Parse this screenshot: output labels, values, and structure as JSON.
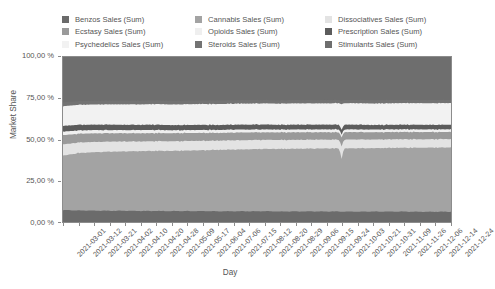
{
  "chart_data": {
    "type": "area",
    "stacked": true,
    "normalized": true,
    "title": "",
    "xlabel": "Day",
    "ylabel": "Market Share",
    "ylim": [
      0,
      100
    ],
    "yunit": "%",
    "grid": false,
    "legend_position": "top",
    "y_tick_labels": [
      "0,00 %",
      "25,00 %",
      "50,00 %",
      "75,00 %",
      "100,00 %"
    ],
    "y_tick_values": [
      0,
      25,
      50,
      75,
      100
    ],
    "x_tick_labels": [
      "2021-03-01",
      "2021-03-12",
      "2021-03-21",
      "2021-04-02",
      "2021-04-10",
      "2021-04-20",
      "2021-04-28",
      "2021-05-09",
      "2021-05-17",
      "2021-06-04",
      "2021-07-06",
      "2021-07-15",
      "2021-08-12",
      "2021-08-20",
      "2021-08-29",
      "2021-09-06",
      "2021-09-15",
      "2021-09-24",
      "2021-10-03",
      "2021-10-21",
      "2021-10-31",
      "2021-11-09",
      "2021-11-26",
      "2021-12-06",
      "2021-12-14",
      "2021-12-24"
    ],
    "series": [
      {
        "name": "Benzos Sales (Sum)",
        "color": "#6b6b6b",
        "values": [
          7.2,
          7.0,
          6.9,
          6.8,
          6.8,
          6.7,
          6.7,
          6.6,
          6.6,
          6.6,
          6.5,
          6.5,
          6.5,
          6.5,
          6.4,
          6.4,
          6.4,
          6.4,
          6.3,
          6.3,
          6.3,
          6.3,
          6.3,
          6.2,
          6.2,
          6.2
        ]
      },
      {
        "name": "Cannabis Sales (Sum)",
        "color": "#a3a3a3",
        "values": [
          33.0,
          34.8,
          35.4,
          35.8,
          36.0,
          36.2,
          36.4,
          36.5,
          36.7,
          36.9,
          37.2,
          37.4,
          37.6,
          37.8,
          37.9,
          38.0,
          38.1,
          38.2,
          38.3,
          38.4,
          38.5,
          38.6,
          38.7,
          38.8,
          38.9,
          39.0
        ]
      },
      {
        "name": "Dissociatives Sales (Sum)",
        "color": "#e3e3e3",
        "values": [
          6.8,
          6.4,
          6.2,
          6.1,
          6.0,
          5.9,
          5.9,
          5.8,
          5.8,
          5.7,
          5.6,
          5.6,
          5.5,
          5.5,
          5.4,
          5.4,
          5.4,
          5.3,
          5.3,
          5.3,
          5.2,
          5.2,
          5.2,
          5.1,
          5.1,
          5.1
        ]
      },
      {
        "name": "Ecstasy Sales (Sum)",
        "color": "#9a9a9a",
        "values": [
          5.6,
          5.3,
          5.2,
          5.1,
          5.0,
          5.0,
          4.9,
          4.9,
          4.8,
          4.8,
          4.7,
          4.7,
          4.7,
          4.6,
          4.6,
          4.6,
          4.5,
          4.5,
          4.5,
          4.5,
          4.4,
          4.4,
          4.4,
          4.4,
          4.3,
          4.3
        ]
      },
      {
        "name": "Opioids Sales (Sum)",
        "color": "#efefef",
        "values": [
          2.1,
          2.0,
          2.0,
          1.9,
          1.9,
          1.9,
          1.9,
          1.8,
          1.8,
          1.8,
          1.8,
          1.8,
          1.7,
          1.7,
          1.7,
          1.7,
          1.7,
          1.7,
          1.7,
          1.6,
          1.6,
          1.6,
          1.6,
          1.6,
          1.6,
          1.6
        ]
      },
      {
        "name": "Prescription Sales (Sum)",
        "color": "#5c5c5c",
        "values": [
          3.6,
          3.4,
          3.3,
          3.3,
          3.2,
          3.2,
          3.2,
          3.1,
          3.1,
          3.1,
          3.0,
          3.0,
          3.0,
          3.0,
          2.9,
          2.9,
          2.9,
          2.9,
          2.9,
          2.9,
          2.8,
          2.8,
          2.8,
          2.8,
          2.8,
          2.8
        ]
      },
      {
        "name": "Psychedelics Sales (Sum)",
        "color": "#f2f2f2",
        "values": [
          11.8,
          12.1,
          12.2,
          12.3,
          12.4,
          12.4,
          12.5,
          12.5,
          12.6,
          12.6,
          12.7,
          12.7,
          12.8,
          12.8,
          12.8,
          12.9,
          12.9,
          12.9,
          13.0,
          13.0,
          13.0,
          13.0,
          13.1,
          13.1,
          13.1,
          13.1
        ]
      },
      {
        "name": "Steroids Sales (Sum)",
        "color": "#737373",
        "values": [
          2.4,
          2.3,
          2.3,
          2.2,
          2.2,
          2.2,
          2.2,
          2.2,
          2.1,
          2.1,
          2.1,
          2.1,
          2.1,
          2.1,
          2.0,
          2.0,
          2.0,
          2.0,
          2.0,
          2.0,
          2.0,
          2.0,
          1.9,
          1.9,
          1.9,
          1.9
        ]
      },
      {
        "name": "Stimulants Sales (Sum)",
        "color": "#6e6e6e",
        "values": [
          27.5,
          26.7,
          26.5,
          26.5,
          26.5,
          26.5,
          26.3,
          26.6,
          26.5,
          26.4,
          26.4,
          26.2,
          26.1,
          26.0,
          26.3,
          26.1,
          26.1,
          26.1,
          26.0,
          26.0,
          26.2,
          26.1,
          26.0,
          26.1,
          26.1,
          26.0
        ]
      }
    ]
  },
  "legend": {
    "columns": [
      [
        {
          "label": "Benzos Sales (Sum)",
          "color": "#6b6b6b"
        },
        {
          "label": "Ecstasy Sales (Sum)",
          "color": "#9a9a9a"
        },
        {
          "label": "Psychedelics Sales (Sum)",
          "color": "#f2f2f2"
        }
      ],
      [
        {
          "label": "Cannabis Sales (Sum)",
          "color": "#a3a3a3"
        },
        {
          "label": "Opioids Sales (Sum)",
          "color": "#efefef"
        },
        {
          "label": "Steroids Sales (Sum)",
          "color": "#737373"
        }
      ],
      [
        {
          "label": "Dissociatives Sales (Sum)",
          "color": "#e3e3e3"
        },
        {
          "label": "Prescription Sales (Sum)",
          "color": "#5c5c5c"
        },
        {
          "label": "Stimulants Sales (Sum)",
          "color": "#6e6e6e"
        }
      ]
    ]
  },
  "colors": {
    "axis": "#8c8c8c",
    "text": "#555555",
    "background": "#ffffff"
  }
}
